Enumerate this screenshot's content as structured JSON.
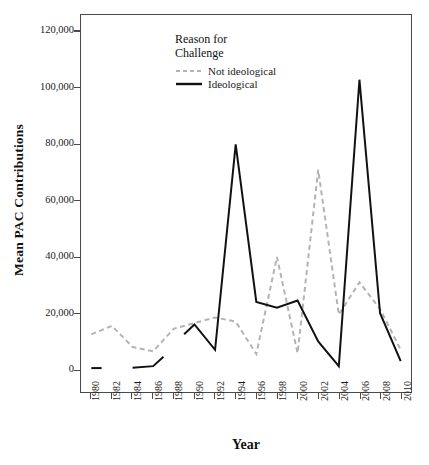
{
  "chart_data": {
    "type": "line",
    "title": "",
    "xlabel": "Year",
    "ylabel": "Mean PAC Contributions",
    "legend_title_line1": "Reason for",
    "legend_title_line2": "Challenge",
    "legend_position": "top-left-inside",
    "grid": false,
    "x": [
      1980,
      1982,
      1984,
      1986,
      1988,
      1990,
      1992,
      1994,
      1996,
      1998,
      2000,
      2002,
      2004,
      2006,
      2008,
      2010
    ],
    "xtick_labels": [
      "1980",
      "1982",
      "1984",
      "1986",
      "1988",
      "1990",
      "1992",
      "1994",
      "1996",
      "1998",
      "2000",
      "2002",
      "2004",
      "2006",
      "2008",
      "2010"
    ],
    "xlim": [
      1979,
      2011
    ],
    "ylim": [
      -8000,
      126000
    ],
    "ytick_values": [
      0,
      20000,
      40000,
      60000,
      80000,
      100000,
      120000
    ],
    "ytick_labels": [
      "0",
      "20,000",
      "40,000",
      "60,000",
      "80,000",
      "100,000",
      "120,000"
    ],
    "series": [
      {
        "name": "Not ideological",
        "style": "dashed",
        "color": "#b3b3b3",
        "width": 2,
        "values": [
          12500,
          15500,
          8000,
          6500,
          14500,
          16500,
          18500,
          17000,
          5500,
          40000,
          5800,
          71000,
          19500,
          31000,
          21500,
          7000
        ]
      },
      {
        "name": "Ideological",
        "style": "solid",
        "color": "#111111",
        "width": 2,
        "segments": [
          {
            "x": [
              1980,
              1981
            ],
            "values": [
              500,
              500
            ]
          },
          {
            "x": [
              1984,
              1986,
              1987
            ],
            "values": [
              600,
              1200,
              4500
            ]
          },
          {
            "x": [
              1989,
              1990,
              1992,
              1994,
              1996,
              1998,
              2000,
              2002,
              2004,
              2006,
              2008,
              2010
            ],
            "values": [
              12500,
              16000,
              7000,
              80000,
              24000,
              22000,
              24500,
              10000,
              1200,
              103000,
              20000,
              3000
            ]
          }
        ],
        "values": [
          500,
          null,
          600,
          1200,
          null,
          16000,
          7000,
          80000,
          24000,
          22000,
          24500,
          10000,
          1200,
          103000,
          20000,
          3000
        ]
      }
    ],
    "colors": {
      "ideological": "#111111",
      "not_ideological": "#b3b3b3",
      "axis": "#4a4a4a",
      "background": "#ffffff"
    }
  }
}
